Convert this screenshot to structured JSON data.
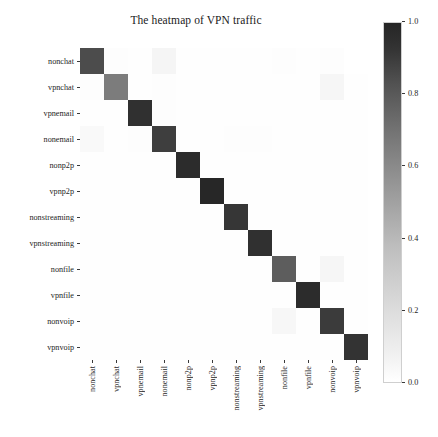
{
  "chart_data": {
    "type": "heatmap",
    "title": "The heatmap of VPN traffic",
    "xlabel": "",
    "ylabel": "",
    "grid": false,
    "legend_position": "right",
    "colorbar": {
      "label": "",
      "vmin": 0.0,
      "vmax": 1.0,
      "ticks": [
        "1.0",
        "0.8",
        "0.6",
        "0.4",
        "0.2",
        "0.0"
      ],
      "tick_values": [
        1.0,
        0.8,
        0.6,
        0.4,
        0.2,
        0.0
      ],
      "colormap": "Greys"
    },
    "x_categories": [
      "nonchat",
      "vpnchat",
      "vpnemail",
      "nonemail",
      "nonp2p",
      "vpnp2p",
      "nonstreaming",
      "vpnstreaming",
      "nonfile",
      "vpnfile",
      "nonvoip",
      "vpnvoip"
    ],
    "y_categories": [
      "nonchat",
      "vpnchat",
      "vpnemail",
      "nonemail",
      "nonp2p",
      "vpnp2p",
      "nonstreaming",
      "vpnstreaming",
      "nonfile",
      "vpnfile",
      "nonvoip",
      "vpnvoip"
    ],
    "values": [
      [
        0.78,
        0.02,
        0.01,
        0.1,
        0.01,
        0.01,
        0.01,
        0.01,
        0.02,
        0.01,
        0.02,
        0.0
      ],
      [
        0.02,
        0.62,
        0.01,
        0.02,
        0.01,
        0.01,
        0.01,
        0.01,
        0.01,
        0.01,
        0.09,
        0.01
      ],
      [
        0.01,
        0.01,
        0.88,
        0.02,
        0.01,
        0.01,
        0.01,
        0.01,
        0.01,
        0.01,
        0.01,
        0.01
      ],
      [
        0.06,
        0.01,
        0.02,
        0.83,
        0.01,
        0.01,
        0.02,
        0.02,
        0.01,
        0.01,
        0.01,
        0.01
      ],
      [
        0.01,
        0.01,
        0.01,
        0.01,
        0.9,
        0.01,
        0.01,
        0.01,
        0.01,
        0.01,
        0.01,
        0.01
      ],
      [
        0.01,
        0.01,
        0.01,
        0.01,
        0.01,
        0.92,
        0.01,
        0.01,
        0.01,
        0.01,
        0.01,
        0.01
      ],
      [
        0.01,
        0.01,
        0.01,
        0.01,
        0.01,
        0.01,
        0.86,
        0.01,
        0.01,
        0.01,
        0.01,
        0.01
      ],
      [
        0.01,
        0.01,
        0.01,
        0.01,
        0.01,
        0.01,
        0.01,
        0.88,
        0.01,
        0.01,
        0.01,
        0.01
      ],
      [
        0.01,
        0.01,
        0.01,
        0.01,
        0.01,
        0.01,
        0.01,
        0.01,
        0.72,
        0.01,
        0.09,
        0.01
      ],
      [
        0.01,
        0.01,
        0.01,
        0.01,
        0.01,
        0.01,
        0.01,
        0.01,
        0.01,
        0.9,
        0.01,
        0.01
      ],
      [
        0.01,
        0.01,
        0.01,
        0.01,
        0.01,
        0.01,
        0.01,
        0.01,
        0.08,
        0.01,
        0.84,
        0.01
      ],
      [
        0.01,
        0.01,
        0.01,
        0.01,
        0.01,
        0.01,
        0.01,
        0.01,
        0.01,
        0.01,
        0.01,
        0.87
      ]
    ]
  }
}
